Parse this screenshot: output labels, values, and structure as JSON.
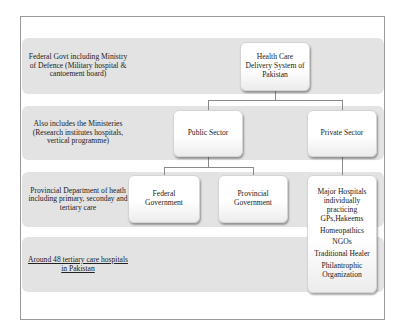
{
  "diagram": {
    "title": "Health Care Delivery System of Pakistan",
    "bands": [
      {
        "label": "Federal Govt including Ministry of Defence (Military hospital & cantoement board)",
        "underlined": false
      },
      {
        "label": "Also includes the Ministeries (Research institutes hospitals, vertical programme)",
        "underlined": false
      },
      {
        "label": "Provincial Department of heath including primary, seconday and tertiary care",
        "underlined": false
      },
      {
        "label": "Around 48 tertiary care hospitals in Pakistan",
        "underlined": true
      }
    ],
    "nodes": {
      "root": "Health Care Delivery System of Pakistan",
      "public_sector": "Public Sector",
      "private_sector": "Private Sector",
      "federal_government": "Federal Government",
      "provincial_government": "Provincial Government",
      "private_list": [
        "Major Hospitals individually practicing GPs,Hakeems",
        "Homeopathics",
        "NGOs",
        "Traditional Healer",
        "Philantrophic Organization"
      ]
    },
    "colors": {
      "band": "#e3e3e3",
      "node": "#ffffff",
      "connector": "#8a8a8a",
      "frame": "#9a9a9a"
    }
  }
}
